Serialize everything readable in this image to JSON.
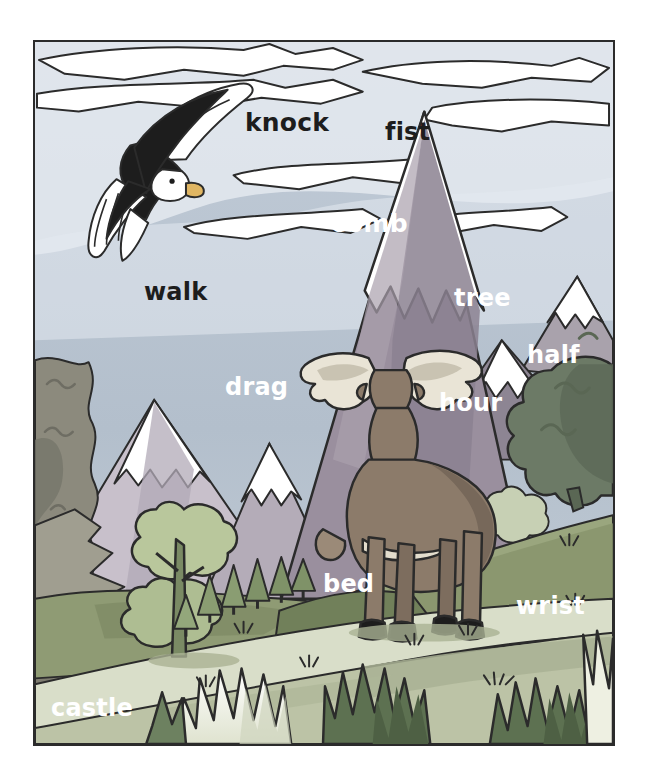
{
  "scene": {
    "title": "Mountain landscape vocabulary picture",
    "frame": {
      "border_color": "#2b2b2b",
      "x": 33,
      "y": 40,
      "width": 582,
      "height": 706
    },
    "palette": {
      "sky": "#b6c2cf",
      "sky_light": "#e8edf2",
      "cloud": "#ffffff",
      "cloud_shadow": "#c9d3dd",
      "snow": "#ffffff",
      "snow_shadow": "#dfe7ee",
      "mountain_main": "#9a8f9e",
      "mountain_main_shadow": "#827889",
      "mountain_far": "#a9a2ac",
      "mountain_left": "#c8c0cb",
      "ridge_left": "#8c8a7d",
      "ridge_left_dark": "#6e6d63",
      "hill_mid": "#8e9a72",
      "hill_mid_dark": "#74805d",
      "meadow": "#b8bfa3",
      "meadow_light": "#d6dcc4",
      "path": "#cdd2bd",
      "tree_dark": "#5f7553",
      "tree_mid": "#7c9068",
      "tree_light": "#9db285",
      "big_tree": "#a8b98e",
      "bush_dark": "#5a6f4e",
      "bush_light": "#f4f5ea",
      "moose_body": "#8c7b6a",
      "moose_dark": "#6f6152",
      "antler": "#e7e2d4",
      "hoof": "#1d1d1d",
      "eagle_body": "#1d1d1d",
      "eagle_head": "#ffffff",
      "eagle_beak": "#e0b663",
      "outline": "#2b2b2b"
    },
    "objects": [
      {
        "name": "bald-eagle",
        "description": "bald eagle flying in upper-left sky"
      },
      {
        "name": "moose",
        "description": "moose with antlers standing in meadow, seen from behind"
      },
      {
        "name": "snow-capped-peaks",
        "count": 6
      },
      {
        "name": "conifer-row",
        "count": 6
      },
      {
        "name": "broadleaf-tree",
        "count": 1
      },
      {
        "name": "foreground-bushes",
        "count": 4
      },
      {
        "name": "clouds",
        "count": 7
      },
      {
        "name": "grass-tufts",
        "count": 7
      }
    ]
  },
  "labels": [
    {
      "id": "knock",
      "text": "knock",
      "x": 243,
      "y": 108,
      "size": 25,
      "tone": "dark"
    },
    {
      "id": "fist",
      "text": "fist",
      "x": 383,
      "y": 118,
      "size": 24,
      "tone": "dark"
    },
    {
      "id": "comb",
      "text": "comb",
      "x": 329,
      "y": 209,
      "size": 25,
      "tone": "light"
    },
    {
      "id": "walk",
      "text": "walk",
      "x": 142,
      "y": 278,
      "size": 24,
      "tone": "dark"
    },
    {
      "id": "tree",
      "text": "tree",
      "x": 452,
      "y": 284,
      "size": 24,
      "tone": "light"
    },
    {
      "id": "half",
      "text": "half",
      "x": 525,
      "y": 341,
      "size": 24,
      "tone": "light"
    },
    {
      "id": "drag",
      "text": "drag",
      "x": 223,
      "y": 373,
      "size": 24,
      "tone": "light"
    },
    {
      "id": "hour",
      "text": "hour",
      "x": 437,
      "y": 389,
      "size": 24,
      "tone": "light"
    },
    {
      "id": "bed",
      "text": "bed",
      "x": 321,
      "y": 570,
      "size": 24,
      "tone": "light"
    },
    {
      "id": "wrist",
      "text": "wrist",
      "x": 514,
      "y": 592,
      "size": 24,
      "tone": "light"
    },
    {
      "id": "castle",
      "text": "castle",
      "x": 49,
      "y": 694,
      "size": 24,
      "tone": "light"
    }
  ]
}
